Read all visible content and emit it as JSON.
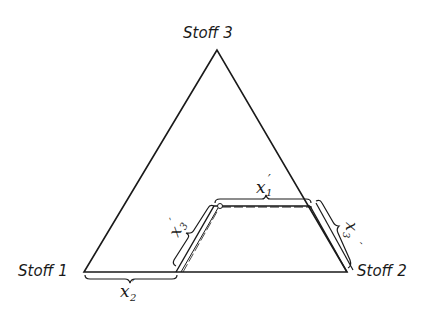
{
  "diagram": {
    "type": "ternary-composition-triangle",
    "vertices": {
      "top": {
        "label": "Stoff 3"
      },
      "left": {
        "label": "Stoff 1"
      },
      "right": {
        "label": "Stoff 2"
      }
    },
    "braces": {
      "top": {
        "base": "x",
        "sub": "1",
        "prime": "′"
      },
      "bottom": {
        "base": "x",
        "sub": "2",
        "prime": "′"
      },
      "left": {
        "base": "x",
        "sub": "3",
        "prime": "′"
      },
      "right": {
        "base": "x",
        "sub": "3",
        "prime": "′"
      }
    },
    "colors": {
      "line": "#1a1a1a",
      "background": "#ffffff"
    }
  }
}
